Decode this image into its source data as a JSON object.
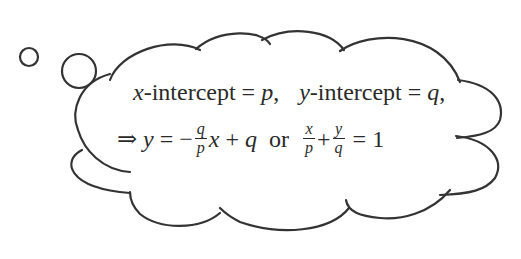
{
  "diagram": {
    "type": "thought-bubble",
    "stroke_color": "#333333",
    "background": "#ffffff",
    "line1": {
      "x_var": "x",
      "x_label": "-intercept",
      "eq": "=",
      "x_value": "p",
      "sep": ",",
      "y_var": "y",
      "y_label": "-intercept",
      "y_value": "q",
      "end": ","
    },
    "line2": {
      "implies": "⇒",
      "lhs": "y",
      "eq": "=",
      "minus": "−",
      "frac1": {
        "num": "q",
        "den": "p"
      },
      "x": "x",
      "plus": "+",
      "q": "q",
      "or": "or",
      "frac2": {
        "num": "x",
        "den": "p"
      },
      "plus2": "+",
      "frac3": {
        "num": "y",
        "den": "q"
      },
      "eq2": "=",
      "rhs": "1"
    }
  }
}
